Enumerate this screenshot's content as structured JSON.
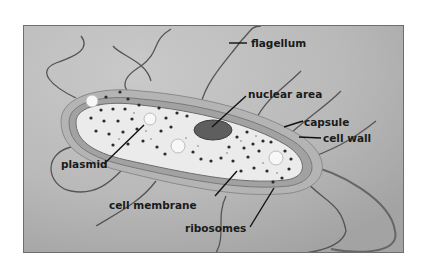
{
  "diagram": {
    "labels": {
      "flagellum": "flagellum",
      "nuclear_area": "nuclear area",
      "capsule": "capsule",
      "cell_wall": "cell wall",
      "plasmid": "plasmid",
      "cell_membrane": "cell membrane",
      "ribosomes": "ribosomes"
    },
    "colors": {
      "background": "#c9c9c9",
      "capsule": "#b4b4b4",
      "cell_wall": "#9c9c9c",
      "cytoplasm": "#ebebeb",
      "nucleoid": "#5e5e5e",
      "ribosome": "#2b2b2b",
      "flagellum": "#555555",
      "label_text": "#1a1a1a",
      "frame_border": "#6e6e6e"
    }
  }
}
